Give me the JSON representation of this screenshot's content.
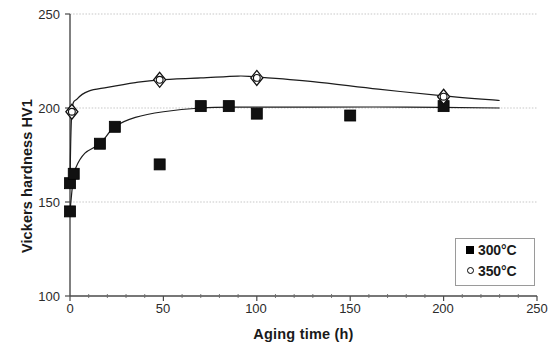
{
  "chart_data": {
    "type": "scatter",
    "title": "",
    "xlabel": "Aging time (h)",
    "ylabel": "Vickers hardness HV1",
    "xlim": [
      0,
      250
    ],
    "ylim": [
      100,
      250
    ],
    "xticks": [
      0,
      50,
      100,
      150,
      200,
      250
    ],
    "yticks": [
      100,
      150,
      200,
      250
    ],
    "xtick_labels": [
      "0",
      "50",
      "100",
      "150",
      "200",
      "250"
    ],
    "ytick_labels": [
      "100",
      "150",
      "200",
      "250"
    ],
    "grid": "horizontal gridlines at 150, 200, 250",
    "legend_position": "bottom-right inside plot",
    "series": [
      {
        "name": "300°C",
        "marker": "filled-square",
        "color": "#000000",
        "points": [
          [
            0,
            145
          ],
          [
            0,
            160
          ],
          [
            2,
            165
          ],
          [
            16,
            181
          ],
          [
            24,
            190
          ],
          [
            48,
            170
          ],
          [
            70,
            201
          ],
          [
            85,
            201
          ],
          [
            100,
            197
          ],
          [
            150,
            196
          ],
          [
            200,
            201
          ]
        ],
        "trend_line": [
          [
            0,
            145
          ],
          [
            1.5,
            160
          ],
          [
            3,
            168
          ],
          [
            8,
            176
          ],
          [
            16,
            181
          ],
          [
            24,
            190
          ],
          [
            35,
            195
          ],
          [
            50,
            198
          ],
          [
            70,
            200
          ],
          [
            90,
            200.5
          ],
          [
            130,
            200.5
          ],
          [
            180,
            200.5
          ],
          [
            230,
            200
          ]
        ]
      },
      {
        "name": "350°C",
        "marker": "open-circle",
        "color": "#000000",
        "points": [
          [
            1,
            198
          ],
          [
            48,
            215
          ],
          [
            100,
            216
          ],
          [
            200,
            206
          ]
        ],
        "trend_line": [
          [
            0,
            160
          ],
          [
            1,
            198
          ],
          [
            4,
            205
          ],
          [
            10,
            209
          ],
          [
            20,
            211
          ],
          [
            35,
            213.5
          ],
          [
            48,
            215
          ],
          [
            70,
            216
          ],
          [
            90,
            217
          ],
          [
            100,
            216.5
          ],
          [
            130,
            214
          ],
          [
            165,
            210
          ],
          [
            200,
            206.5
          ],
          [
            230,
            204
          ]
        ]
      }
    ]
  },
  "legend": {
    "entries": [
      {
        "label": "300°C",
        "marker": "filled-square"
      },
      {
        "label": "350°C",
        "marker": "open-circle"
      }
    ]
  }
}
